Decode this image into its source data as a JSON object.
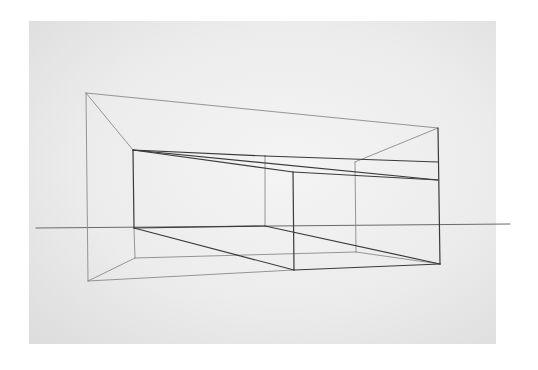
{
  "image": {
    "subject": "Pencil two-point/one-point perspective line drawing of an open box-like room on paper",
    "background_color": "#ffffff",
    "paper_color": "#ececec",
    "line_color": "#3a3a3a",
    "faint_line_color": "#8a8a8a"
  },
  "drawing": {
    "horizon": [
      [
        36,
        228
      ],
      [
        510,
        224
      ]
    ],
    "lines_dark": [
      [
        [
          133,
          150
        ],
        [
          438,
          180
        ]
      ],
      [
        [
          133,
          150
        ],
        [
          265,
          156
        ]
      ],
      [
        [
          265,
          156
        ],
        [
          438,
          162
        ]
      ],
      [
        [
          133,
          150
        ],
        [
          293,
          172
        ]
      ],
      [
        [
          293,
          172
        ],
        [
          438,
          180
        ]
      ],
      [
        [
          133,
          150
        ],
        [
          134,
          228
        ]
      ],
      [
        [
          293,
          172
        ],
        [
          294,
          270
        ]
      ],
      [
        [
          438,
          128
        ],
        [
          440,
          264
        ]
      ],
      [
        [
          134,
          228
        ],
        [
          294,
          270
        ]
      ],
      [
        [
          134,
          228
        ],
        [
          265,
          226
        ]
      ],
      [
        [
          265,
          226
        ],
        [
          440,
          264
        ]
      ],
      [
        [
          294,
          270
        ],
        [
          440,
          264
        ]
      ]
    ],
    "lines_light": [
      [
        [
          86,
          93
        ],
        [
          438,
          128
        ]
      ],
      [
        [
          86,
          93
        ],
        [
          133,
          150
        ]
      ],
      [
        [
          438,
          128
        ],
        [
          355,
          162
        ]
      ],
      [
        [
          86,
          93
        ],
        [
          88,
          281
        ]
      ],
      [
        [
          88,
          281
        ],
        [
          135,
          258
        ]
      ],
      [
        [
          88,
          281
        ],
        [
          294,
          270
        ]
      ],
      [
        [
          135,
          258
        ],
        [
          356,
          252
        ]
      ],
      [
        [
          134,
          228
        ],
        [
          135,
          258
        ]
      ],
      [
        [
          265,
          156
        ],
        [
          265,
          226
        ]
      ],
      [
        [
          355,
          162
        ],
        [
          356,
          252
        ]
      ],
      [
        [
          356,
          252
        ],
        [
          440,
          264
        ]
      ]
    ]
  }
}
